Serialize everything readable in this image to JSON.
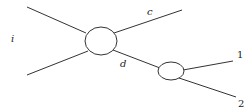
{
  "diagram": {
    "type": "feynman-decay-diagram",
    "labels": {
      "incoming": "i",
      "upper_out": "c",
      "intermediate": "d",
      "final_1": "1",
      "final_2": "2"
    },
    "colors": {
      "stroke": "#333333",
      "text": "#222222",
      "background": "#ffffff"
    }
  }
}
